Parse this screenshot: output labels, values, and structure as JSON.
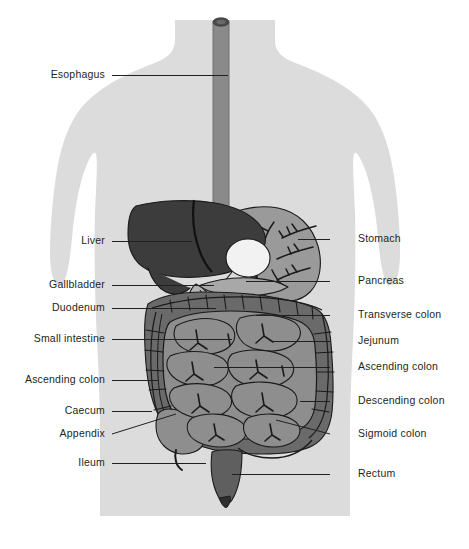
{
  "canvas": {
    "width": 469,
    "height": 549,
    "background": "#ffffff"
  },
  "colors": {
    "background": "#ffffff",
    "body_silhouette": "#dcdcdc",
    "liver": "#3c3c3c",
    "stomach": "#9a9a9a",
    "gallbladder": "#f2f2f2",
    "duodenum": "#b4b4b4",
    "pancreas": "#a8a8a8",
    "colon": "#6a6a6a",
    "small_intestine": "#8e8e8e",
    "esophagus": "#8a8a8a",
    "esophagus_rim": "#4a4a4a",
    "rectum": "#5f5f5f",
    "anus": "#2e2e2e",
    "outline": "#1a1a1a",
    "label_text": "#231f20",
    "leader_line": "#231f20"
  },
  "labels_left": [
    {
      "id": "esophagus",
      "text": "Esophagus",
      "text_x": 105,
      "text_y": 78,
      "line_x1": 112,
      "line_y1": 75,
      "line_x2": 228,
      "line_y2": 75
    },
    {
      "id": "liver",
      "text": "Liver",
      "text_x": 105,
      "text_y": 244,
      "line_x1": 112,
      "line_y1": 241,
      "line_x2": 192,
      "line_y2": 241
    },
    {
      "id": "gallbladder",
      "text": "Gallbladder",
      "text_x": 105,
      "text_y": 288,
      "line_x1": 112,
      "line_y1": 285,
      "line_x2": 214,
      "line_y2": 285
    },
    {
      "id": "duodenum",
      "text": "Duodenum",
      "text_x": 105,
      "text_y": 311,
      "line_x1": 112,
      "line_y1": 308,
      "line_x2": 216,
      "line_y2": 308
    },
    {
      "id": "small-intestine",
      "text": "Small intestine",
      "text_x": 105,
      "text_y": 342,
      "line_x1": 112,
      "line_y1": 339,
      "line_x2": 232,
      "line_y2": 339
    },
    {
      "id": "ascending-colon",
      "text": "Ascending colon",
      "text_x": 105,
      "text_y": 383,
      "line_x1": 112,
      "line_y1": 380,
      "line_x2": 158,
      "line_y2": 380
    },
    {
      "id": "caecum",
      "text": "Caecum",
      "text_x": 105,
      "text_y": 414,
      "line_x1": 112,
      "line_y1": 411,
      "line_x2": 152,
      "line_y2": 411
    },
    {
      "id": "appendix",
      "text": "Appendix",
      "text_x": 105,
      "text_y": 437,
      "line_x1": 112,
      "line_y1": 434,
      "line_x2": 176,
      "line_y2": 414
    },
    {
      "id": "ileum",
      "text": "Ileum",
      "text_x": 105,
      "text_y": 466,
      "line_x1": 112,
      "line_y1": 463,
      "line_x2": 206,
      "line_y2": 463
    }
  ],
  "labels_right": [
    {
      "id": "stomach",
      "text": "Stomach",
      "text_x": 358,
      "text_y": 242,
      "line_x1": 330,
      "line_y1": 239,
      "line_x2": 298,
      "line_y2": 239
    },
    {
      "id": "pancreas",
      "text": "Pancreas",
      "text_x": 358,
      "text_y": 284,
      "line_x1": 330,
      "line_y1": 281,
      "line_x2": 246,
      "line_y2": 281
    },
    {
      "id": "transverse-colon",
      "text": "Transverse colon",
      "text_x": 358,
      "text_y": 318,
      "line_x1": 330,
      "line_y1": 315,
      "line_x2": 256,
      "line_y2": 315
    },
    {
      "id": "jejunum",
      "text": "Jejunum",
      "text_x": 358,
      "text_y": 344,
      "line_x1": 330,
      "line_y1": 341,
      "line_x2": 272,
      "line_y2": 341
    },
    {
      "id": "ascending-colon-r",
      "text": "Ascending colon",
      "text_x": 358,
      "text_y": 370,
      "line_x1": 330,
      "line_y1": 367,
      "line_x2": 214,
      "line_y2": 367
    },
    {
      "id": "descending-colon",
      "text": "Descending colon",
      "text_x": 358,
      "text_y": 404,
      "line_x1": 330,
      "line_y1": 401,
      "line_x2": 300,
      "line_y2": 401
    },
    {
      "id": "sigmoid-colon",
      "text": "Sigmoid colon",
      "text_x": 358,
      "text_y": 437,
      "line_x1": 330,
      "line_y1": 434,
      "line_x2": 276,
      "line_y2": 420
    },
    {
      "id": "rectum",
      "text": "Rectum",
      "text_x": 358,
      "text_y": 477,
      "line_x1": 330,
      "line_y1": 474,
      "line_x2": 232,
      "line_y2": 474
    }
  ],
  "organs": [
    {
      "id": "esophagus",
      "name": "Esophagus"
    },
    {
      "id": "liver",
      "name": "Liver"
    },
    {
      "id": "stomach",
      "name": "Stomach"
    },
    {
      "id": "gallbladder",
      "name": "Gallbladder"
    },
    {
      "id": "duodenum",
      "name": "Duodenum"
    },
    {
      "id": "pancreas",
      "name": "Pancreas"
    },
    {
      "id": "transverse-colon",
      "name": "Transverse colon"
    },
    {
      "id": "ascending-colon",
      "name": "Ascending colon"
    },
    {
      "id": "descending-colon",
      "name": "Descending colon"
    },
    {
      "id": "sigmoid-colon",
      "name": "Sigmoid colon"
    },
    {
      "id": "small-intestine",
      "name": "Small intestine"
    },
    {
      "id": "jejunum",
      "name": "Jejunum"
    },
    {
      "id": "ileum",
      "name": "Ileum"
    },
    {
      "id": "caecum",
      "name": "Caecum"
    },
    {
      "id": "appendix",
      "name": "Appendix"
    },
    {
      "id": "rectum",
      "name": "Rectum"
    }
  ]
}
